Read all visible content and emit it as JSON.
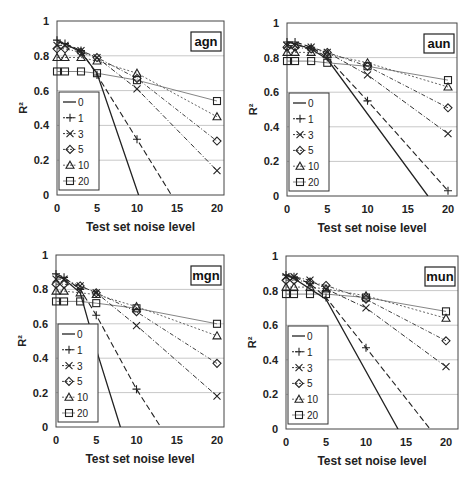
{
  "chart_data": [
    {
      "type": "line",
      "title": "agn",
      "xlabel": "Test set noise level",
      "ylabel": "R²",
      "xlim": [
        0,
        20
      ],
      "ylim": [
        0,
        1
      ],
      "xticks": [
        "0",
        "5",
        "10",
        "15",
        "20"
      ],
      "yticks": [
        "0",
        "0.2",
        "0.4",
        "0.6",
        "0.8",
        "1"
      ],
      "grid": "horizontal",
      "legend_position": "lower-left inside",
      "x": [
        0,
        1,
        3,
        5,
        10,
        20
      ],
      "series": [
        {
          "name": "0",
          "values": [
            0.88,
            0.87,
            0.82,
            0.7,
            null,
            null
          ],
          "zero_at": 10.2
        },
        {
          "name": "1",
          "values": [
            0.89,
            0.87,
            0.83,
            0.69,
            0.32,
            null
          ],
          "zero_at": 14.3
        },
        {
          "name": "3",
          "values": [
            0.86,
            0.86,
            0.83,
            0.79,
            0.61,
            0.14
          ]
        },
        {
          "name": "5",
          "values": [
            0.84,
            0.84,
            0.82,
            0.79,
            0.67,
            0.31
          ]
        },
        {
          "name": "10",
          "values": [
            0.79,
            0.79,
            0.79,
            0.77,
            0.7,
            0.45
          ]
        },
        {
          "name": "20",
          "values": [
            0.71,
            0.71,
            0.71,
            0.7,
            0.66,
            0.54
          ]
        }
      ]
    },
    {
      "type": "line",
      "title": "aun",
      "xlabel": "Test set noise level",
      "ylabel": "R²",
      "xlim": [
        0,
        20
      ],
      "ylim": [
        0,
        1
      ],
      "xticks": [
        "0",
        "5",
        "10",
        "15",
        "20"
      ],
      "yticks": [
        "0",
        "0.2",
        "0.4",
        "0.6",
        "0.8",
        "1"
      ],
      "grid": "horizontal",
      "legend_position": "lower-left inside",
      "x": [
        0,
        1,
        3,
        5,
        10,
        20
      ],
      "series": [
        {
          "name": "0",
          "values": [
            0.89,
            0.88,
            0.85,
            0.79,
            null,
            null
          ],
          "zero_at": 17.5
        },
        {
          "name": "1",
          "values": [
            0.89,
            0.89,
            0.86,
            0.8,
            0.55,
            0.03
          ]
        },
        {
          "name": "3",
          "values": [
            0.87,
            0.87,
            0.86,
            0.83,
            0.7,
            0.36
          ]
        },
        {
          "name": "5",
          "values": [
            0.86,
            0.86,
            0.85,
            0.83,
            0.75,
            0.51
          ]
        },
        {
          "name": "10",
          "values": [
            0.83,
            0.83,
            0.83,
            0.82,
            0.77,
            0.63
          ]
        },
        {
          "name": "20",
          "values": [
            0.78,
            0.78,
            0.78,
            0.77,
            0.75,
            0.67
          ]
        }
      ]
    },
    {
      "type": "line",
      "title": "mgn",
      "xlabel": "Test set noise level",
      "ylabel": "R²",
      "xlim": [
        0,
        20
      ],
      "ylim": [
        0,
        1
      ],
      "xticks": [
        "0",
        "5",
        "10",
        "15",
        "20"
      ],
      "yticks": [
        "0",
        "0.2",
        "0.4",
        "0.6",
        "0.8",
        "1"
      ],
      "grid": "horizontal",
      "legend_position": "lower-left inside",
      "x": [
        0,
        1,
        3,
        5,
        10,
        20
      ],
      "series": [
        {
          "name": "0",
          "values": [
            0.88,
            0.86,
            0.78,
            0.45,
            null,
            null
          ],
          "zero_at": 8.0
        },
        {
          "name": "1",
          "values": [
            0.89,
            0.87,
            0.8,
            0.65,
            0.22,
            null
          ],
          "zero_at": 13.0
        },
        {
          "name": "3",
          "values": [
            0.86,
            0.86,
            0.82,
            0.78,
            0.59,
            0.18
          ]
        },
        {
          "name": "5",
          "values": [
            0.83,
            0.83,
            0.82,
            0.78,
            0.67,
            0.37
          ]
        },
        {
          "name": "10",
          "values": [
            0.79,
            0.79,
            0.78,
            0.77,
            0.7,
            0.53
          ]
        },
        {
          "name": "20",
          "values": [
            0.73,
            0.73,
            0.73,
            0.72,
            0.69,
            0.6
          ]
        }
      ]
    },
    {
      "type": "line",
      "title": "mun",
      "xlabel": "Test set noise level",
      "ylabel": "R²",
      "xlim": [
        0,
        20
      ],
      "ylim": [
        0,
        1
      ],
      "xticks": [
        "0",
        "5",
        "10",
        "15",
        "20"
      ],
      "yticks": [
        "0",
        "0.2",
        "0.4",
        "0.6",
        "0.8",
        "1"
      ],
      "grid": "horizontal",
      "legend_position": "lower-left inside",
      "x": [
        0,
        1,
        3,
        5,
        10,
        20
      ],
      "series": [
        {
          "name": "0",
          "values": [
            0.89,
            0.87,
            0.81,
            0.75,
            null,
            null
          ],
          "zero_at": 14.0
        },
        {
          "name": "1",
          "values": [
            0.89,
            0.88,
            0.84,
            0.76,
            0.47,
            null
          ],
          "zero_at": 18.0
        },
        {
          "name": "3",
          "values": [
            0.88,
            0.88,
            0.86,
            0.81,
            0.7,
            0.36
          ]
        },
        {
          "name": "5",
          "values": [
            0.86,
            0.86,
            0.85,
            0.83,
            0.75,
            0.51
          ]
        },
        {
          "name": "10",
          "values": [
            0.82,
            0.82,
            0.82,
            0.81,
            0.77,
            0.64
          ]
        },
        {
          "name": "20",
          "values": [
            0.78,
            0.78,
            0.78,
            0.78,
            0.76,
            0.68
          ]
        }
      ]
    }
  ],
  "colors": {
    "line": "#222222",
    "grid": "#c8c8c8",
    "axis": "#444444"
  }
}
